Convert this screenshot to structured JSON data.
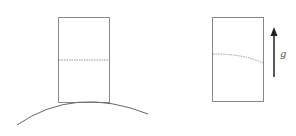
{
  "figure": {
    "left_panel": {
      "description": "rectangular block resting on top of a convex curved surface, with a horizontal dotted line at mid-height"
    },
    "right_panel": {
      "description": "rectangular block with a curved dotted line sloping downward to the right",
      "arrow_label": "g"
    }
  }
}
